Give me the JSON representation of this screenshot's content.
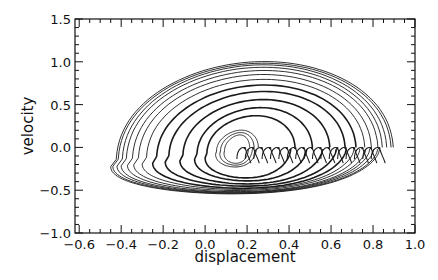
{
  "chart_data": {
    "type": "line",
    "title": "",
    "xlabel": "displacement",
    "ylabel": "velocity",
    "xlim": [
      -0.62,
      1.0
    ],
    "ylim": [
      -1.0,
      1.5
    ],
    "x_ticks": [
      -0.6,
      -0.4,
      -0.2,
      0.0,
      0.2,
      0.4,
      0.6,
      0.8,
      1.0
    ],
    "x_tick_labels": [
      "−0.6",
      "−0.4",
      "−0.2",
      "0.0",
      "0.2",
      "0.4",
      "0.6",
      "0.8",
      "1.0"
    ],
    "y_ticks": [
      -1.0,
      -0.5,
      0.0,
      0.5,
      1.0,
      1.5
    ],
    "y_tick_labels": [
      "−1.0",
      "−0.5",
      "0.0",
      "0.5",
      "1.0",
      "1.5"
    ],
    "x_minor_step": 0.05,
    "y_minor_step": 0.1,
    "grid": false,
    "legend": null,
    "line_color": "#1a1a1a",
    "series": [
      {
        "name": "trajectory-1",
        "x0": 0.87,
        "peak_v": 1.07,
        "left_x": -0.45,
        "bottom_v": -0.47
      },
      {
        "name": "trajectory-2",
        "x0": 0.86,
        "peak_v": 1.05,
        "left_x": -0.44,
        "bottom_v": -0.465
      },
      {
        "name": "trajectory-3",
        "x0": 0.84,
        "peak_v": 1.03,
        "left_x": -0.42,
        "bottom_v": -0.46
      },
      {
        "name": "trajectory-4",
        "x0": 0.82,
        "peak_v": 1.0,
        "left_x": -0.4,
        "bottom_v": -0.455
      },
      {
        "name": "trajectory-5",
        "x0": 0.8,
        "peak_v": 0.96,
        "left_x": -0.37,
        "bottom_v": -0.45
      },
      {
        "name": "trajectory-6",
        "x0": 0.77,
        "peak_v": 0.91,
        "left_x": -0.34,
        "bottom_v": -0.44
      },
      {
        "name": "trajectory-7",
        "x0": 0.74,
        "peak_v": 0.85,
        "left_x": -0.3,
        "bottom_v": -0.43
      },
      {
        "name": "trajectory-8",
        "x0": 0.7,
        "peak_v": 0.78,
        "left_x": -0.25,
        "bottom_v": -0.42
      },
      {
        "name": "trajectory-9",
        "x0": 0.65,
        "peak_v": 0.7,
        "left_x": -0.19,
        "bottom_v": -0.4
      },
      {
        "name": "trajectory-10",
        "x0": 0.58,
        "peak_v": 0.6,
        "left_x": -0.12,
        "bottom_v": -0.38
      },
      {
        "name": "trajectory-11",
        "x0": 0.5,
        "peak_v": 0.5,
        "left_x": -0.05,
        "bottom_v": -0.35
      },
      {
        "name": "trajectory-12",
        "x0": 0.42,
        "peak_v": 0.4,
        "left_x": 0.0,
        "bottom_v": -0.32
      },
      {
        "name": "trajectory-13",
        "x0": 0.25,
        "peak_v": 0.22,
        "left_x": 0.05,
        "bottom_v": -0.2
      },
      {
        "name": "trajectory-14",
        "x0": 0.23,
        "peak_v": 0.19,
        "left_x": 0.07,
        "bottom_v": -0.18
      },
      {
        "name": "trajectory-15",
        "x0": 0.21,
        "peak_v": 0.16,
        "left_x": 0.09,
        "bottom_v": -0.16
      }
    ],
    "hooks": {
      "description": "Small settling hooks along v≈0 near the right end of each trajectory",
      "x_positions": [
        0.18,
        0.22,
        0.26,
        0.3,
        0.34,
        0.38,
        0.42,
        0.46,
        0.5,
        0.54,
        0.58,
        0.62,
        0.66,
        0.7,
        0.74,
        0.78,
        0.82
      ],
      "v_level": -0.02
    }
  }
}
